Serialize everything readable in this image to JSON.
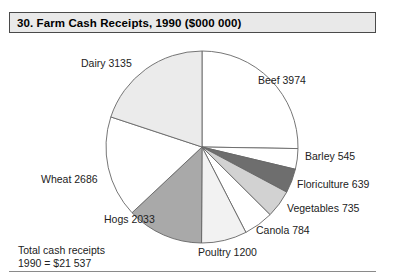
{
  "header": {
    "title": "30. Farm Cash Receipts, 1990 ($000 000)"
  },
  "footnote": {
    "line1": "Total cash receipts",
    "line2": "1990 = $21 537"
  },
  "labels": {
    "beef": "Beef 3974",
    "barley": "Barley 545",
    "floriculture": "Floriculture 639",
    "vegetables": "Vegetables 735",
    "canola": "Canola 784",
    "poultry": "Poultry 1200",
    "hogs": "Hogs 2033",
    "wheat": "Wheat 2686",
    "dairy": "Dairy 3135"
  },
  "chart_data": {
    "type": "pie",
    "title": "30. Farm Cash Receipts, 1990 ($000 000)",
    "units": "$000 000",
    "year": 1990,
    "total_label": "Total cash receipts 1990 = $21 537",
    "total_value": 21537,
    "sum_of_slices": 15731,
    "start_angle_deg": 0,
    "direction": "clockwise",
    "legend": "none (direct slice labels)",
    "categories": [
      "Beef",
      "Barley",
      "Floriculture",
      "Vegetables",
      "Canola",
      "Poultry",
      "Hogs",
      "Wheat",
      "Dairy"
    ],
    "values": [
      3974,
      545,
      639,
      735,
      784,
      1200,
      2033,
      2686,
      3135
    ],
    "slices": [
      {
        "name": "Beef",
        "value": 3974,
        "label": "Beef 3974",
        "color": "#ffffff"
      },
      {
        "name": "Barley",
        "value": 545,
        "label": "Barley 545",
        "color": "#ffffff"
      },
      {
        "name": "Floriculture",
        "value": 639,
        "label": "Floriculture 639",
        "color": "#6e6e6e"
      },
      {
        "name": "Vegetables",
        "value": 735,
        "label": "Vegetables 735",
        "color": "#d2d2d2"
      },
      {
        "name": "Canola",
        "value": 784,
        "label": "Canola 784",
        "color": "#ffffff"
      },
      {
        "name": "Poultry",
        "value": 1200,
        "label": "Poultry 1200",
        "color": "#f2f2f2"
      },
      {
        "name": "Hogs",
        "value": 2033,
        "label": "Hogs 2033",
        "color": "#a9a9a9"
      },
      {
        "name": "Wheat",
        "value": 2686,
        "label": "Wheat 2686",
        "color": "#ffffff"
      },
      {
        "name": "Dairy",
        "value": 3135,
        "label": "Dairy 3135",
        "color": "#ebebeb"
      }
    ],
    "geometry": {
      "cx": 202,
      "cy": 147,
      "r": 96
    },
    "colors": {
      "stroke": "#666666",
      "title_bg": "#e9e9e9",
      "title_border": "#4a4a4a",
      "text": "#222222"
    }
  }
}
